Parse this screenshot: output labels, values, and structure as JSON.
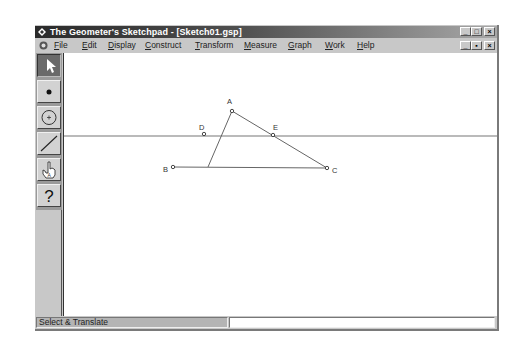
{
  "window": {
    "title": "The Geometer's Sketchpad - [Sketch01.gsp]",
    "title_buttons": [
      "minimize",
      "maximize",
      "close"
    ],
    "doc_buttons": [
      "minimize",
      "restore",
      "close"
    ]
  },
  "menubar": {
    "items": [
      {
        "label": "File",
        "mnemonic": "F"
      },
      {
        "label": "Edit",
        "mnemonic": "E"
      },
      {
        "label": "Display",
        "mnemonic": "D"
      },
      {
        "label": "Construct",
        "mnemonic": "C"
      },
      {
        "label": "Transform",
        "mnemonic": "T"
      },
      {
        "label": "Measure",
        "mnemonic": "M"
      },
      {
        "label": "Graph",
        "mnemonic": "G"
      },
      {
        "label": "Work",
        "mnemonic": "W"
      },
      {
        "label": "Help",
        "mnemonic": "H"
      }
    ]
  },
  "toolbox": {
    "tools": [
      {
        "name": "selection-arrow",
        "icon": "arrow-icon",
        "active": true
      },
      {
        "name": "point",
        "icon": "point-icon",
        "active": false
      },
      {
        "name": "compass",
        "icon": "circle-icon",
        "active": false
      },
      {
        "name": "straightedge",
        "icon": "segment-icon",
        "active": false
      },
      {
        "name": "text",
        "icon": "hand-icon",
        "active": false
      },
      {
        "name": "object-info",
        "icon": "question-icon",
        "active": false
      }
    ],
    "question_glyph": "?"
  },
  "sketch": {
    "points": [
      {
        "label": "A",
        "x": 203,
        "y": 58
      },
      {
        "label": "D",
        "x": 175,
        "y": 81
      },
      {
        "label": "E",
        "x": 244,
        "y": 81
      },
      {
        "label": "B",
        "x": 144,
        "y": 114
      },
      {
        "label": "C",
        "x": 299,
        "y": 115
      }
    ],
    "segments": [
      [
        "A",
        "B"
      ],
      [
        "A",
        "C"
      ],
      [
        "B",
        "C"
      ]
    ],
    "line_through": [
      "D",
      "E"
    ],
    "line_y": 83
  },
  "statusbar": {
    "mode": "Select & Translate"
  }
}
